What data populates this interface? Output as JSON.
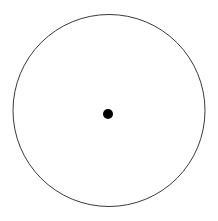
{
  "figure": {
    "title": "",
    "caption": "",
    "type": "geometric-diagram",
    "canvas": {
      "width": 218,
      "height": 221,
      "background_color": "#ffffff"
    },
    "shapes": {
      "circle": {
        "label": "",
        "center_x": 109,
        "center_y": 110.5,
        "radius": 96,
        "stroke_color": "#3a3a3a",
        "stroke_width": 1,
        "fill_color": "none"
      },
      "center_point": {
        "label": "",
        "center_x": 108,
        "center_y": 114,
        "radius": 5,
        "fill_color": "#000000",
        "stroke_color": "none"
      }
    }
  }
}
